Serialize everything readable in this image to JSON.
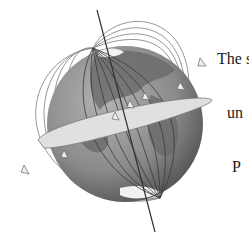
{
  "figure": {
    "elements": [
      "globe",
      "rotation-axis",
      "equatorial-rotation-ring",
      "magnetic-field-lines",
      "direction-arrows"
    ],
    "colors": {
      "globe_ocean": "#8a8a8a",
      "globe_land": "#5e5e5e",
      "field_line": "#7a7a7a",
      "ring": "#d9d9d9",
      "background": "#ffffff"
    }
  },
  "caption": {
    "lines": [
      "The s",
      "un",
      "P"
    ]
  }
}
